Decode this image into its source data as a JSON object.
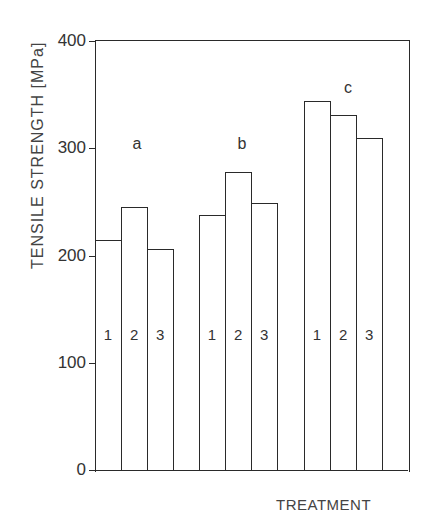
{
  "chart_data": {
    "type": "bar",
    "title": "",
    "xlabel": "TREATMENT",
    "ylabel": "TENSILE STRENGTH [MPa]",
    "ylim": [
      0,
      400
    ],
    "yticks": [
      0,
      100,
      200,
      300,
      400
    ],
    "grid": false,
    "legend": null,
    "groups": [
      "a",
      "b",
      "c"
    ],
    "categories": [
      "1",
      "2",
      "3"
    ],
    "series": [
      {
        "name": "a",
        "values": [
          214,
          245,
          206
        ]
      },
      {
        "name": "b",
        "values": [
          238,
          278,
          249
        ]
      },
      {
        "name": "c",
        "values": [
          344,
          331,
          310
        ]
      }
    ]
  },
  "labels": {
    "ylabel": "TENSILE STRENGTH [MPa]",
    "xlabel": "TREATMENT",
    "yticks": [
      "0",
      "100",
      "200",
      "300",
      "400"
    ],
    "groups": [
      "a",
      "b",
      "c"
    ],
    "bars": [
      "1",
      "2",
      "3"
    ]
  }
}
